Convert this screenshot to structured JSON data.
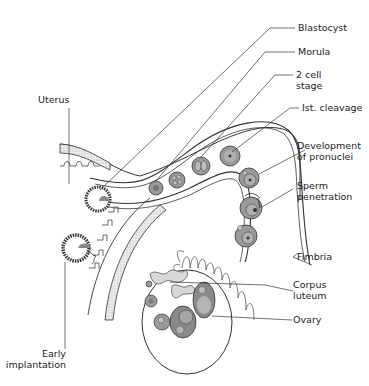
{
  "diagram": {
    "labels": {
      "blastocyst": "Blastocyst",
      "morula": "Morula",
      "two_cell_line1": "2 cell",
      "two_cell_line2": "stage",
      "first_cleavage": "Ist. cleavage",
      "uterus": "Uterus",
      "pronuclei_line1": "Development",
      "pronuclei_line2": "of pronuclei",
      "sperm_line1": "Sperm",
      "sperm_line2": "penetration",
      "fimbria": "Fimbria",
      "corpus_line1": "Corpus",
      "corpus_line2": "luteum",
      "ovary": "Ovary",
      "implant_line1": "Early",
      "implant_line2": "implantation"
    },
    "colors": {
      "line": "#333333",
      "cell_fill": "#9a9a9a",
      "cell_inner": "#b8b8b8",
      "wall_fill": "#e2e2e2"
    }
  }
}
